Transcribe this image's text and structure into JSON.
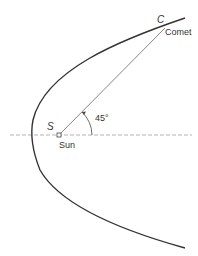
{
  "diagram": {
    "labels": {
      "sun_point": "S",
      "sun": "Sun",
      "comet_point": "C",
      "comet": "Comet",
      "angle": "45°"
    },
    "colors": {
      "orbit": "#333333",
      "radius_line": "#555555",
      "axis": "#999999",
      "text": "#333333"
    },
    "geometry": {
      "axis_y": 135,
      "sun": [
        59,
        135
      ],
      "vertex": [
        32,
        135
      ],
      "comet": [
        165,
        28
      ],
      "angle_deg": 45
    }
  }
}
